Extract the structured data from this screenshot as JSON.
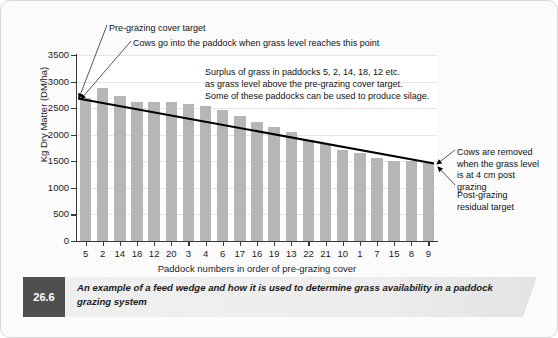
{
  "figure": {
    "number": "26.6",
    "caption": "An example of a feed wedge and how it is used to determine grass availability in a paddock grazing system"
  },
  "annotations": {
    "pre_grazing_target": "Pre-grazing cover target",
    "cows_in": "Cows go into the paddock when grass level reaches this point",
    "surplus": "Surplus of grass in paddocks 5, 2, 14, 18, 12 etc.\nas grass level above the pre-grazing cover target.\nSome of these paddocks can be used to produce silage.",
    "cows_removed": "Cows are removed\nwhen the grass level\nis at 4 cm post grazing",
    "post_grazing_residual": "Post-grazing\nresidual target"
  },
  "colors": {
    "bar": "#b6b6b6",
    "axis": "#3a3a3a",
    "wedge_line": "#000000",
    "gridline": "#e6e6e6",
    "caption_badge": "#4f4f4f",
    "caption_band": "#ededed"
  },
  "chart_data": {
    "type": "bar",
    "title": "",
    "xlabel": "Paddock numbers in order of pre-grazing cover",
    "ylabel": "Kg Dry Matter (DM/ha)",
    "ylim": [
      0,
      3500
    ],
    "yticks": [
      0,
      500,
      1000,
      1500,
      2000,
      2500,
      3000,
      3500
    ],
    "grid": true,
    "legend": "none",
    "categories": [
      "5",
      "2",
      "14",
      "18",
      "12",
      "20",
      "3",
      "4",
      "6",
      "17",
      "16",
      "19",
      "13",
      "22",
      "21",
      "10",
      "1",
      "7",
      "15",
      "8",
      "9"
    ],
    "values": [
      2700,
      2880,
      2720,
      2620,
      2620,
      2610,
      2570,
      2540,
      2470,
      2360,
      2240,
      2150,
      2050,
      1900,
      1820,
      1710,
      1660,
      1560,
      1500,
      1500,
      1460
    ],
    "series": [
      {
        "name": "Pre-grazing cover (kg DM/ha)",
        "values": [
          2700,
          2880,
          2720,
          2620,
          2620,
          2610,
          2570,
          2540,
          2470,
          2360,
          2240,
          2150,
          2050,
          1900,
          1820,
          1710,
          1660,
          1560,
          1500,
          1500,
          1460
        ]
      }
    ],
    "overlay_line": {
      "name": "Feed wedge demand line",
      "start": {
        "category": "5",
        "value": 2680
      },
      "end": {
        "category": "9",
        "value": 1460
      }
    }
  }
}
